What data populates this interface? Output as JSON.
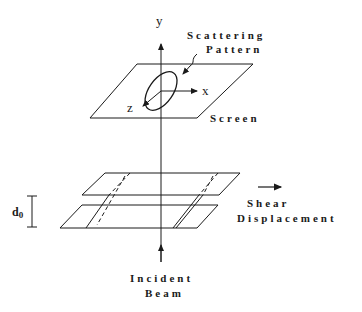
{
  "diagram": {
    "type": "schematic",
    "labels": {
      "y_axis": "y",
      "x_axis": "x",
      "z_axis": "z",
      "scattering_line1": "Scattering",
      "scattering_line2": "Pattern",
      "screen": "Screen",
      "d0_main": "d",
      "d0_sub": "0",
      "shear_line1": "Shear",
      "shear_line2": "Displacement",
      "incident_line1": "Incident",
      "incident_line2": "Beam"
    },
    "elements": [
      {
        "id": "screen",
        "shape": "parallelogram"
      },
      {
        "id": "scattering-pattern",
        "shape": "ellipse"
      },
      {
        "id": "upper-plate",
        "shape": "parallelogram"
      },
      {
        "id": "lower-plate",
        "shape": "parallelogram"
      },
      {
        "id": "beam-axis",
        "shape": "vertical-line"
      },
      {
        "id": "shear-arrow",
        "shape": "arrow"
      },
      {
        "id": "d0-dimension",
        "shape": "dimension-bar"
      }
    ],
    "colors": {
      "stroke": "#1a1a1a",
      "background": "#ffffff"
    }
  }
}
